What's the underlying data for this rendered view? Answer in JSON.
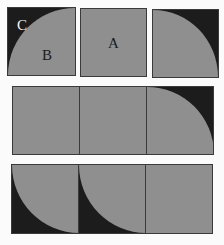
{
  "diagram": {
    "colors": {
      "gray": "#8f8f8f",
      "dark": "#1c1c1c",
      "border": "#3a3a3a",
      "background": "#fbfbfb"
    },
    "row1": {
      "tiles": [
        {
          "id": "tile-1",
          "shading": "quarter-circle centered bottom-right, dark top-left corner",
          "labels": [
            "C",
            "B"
          ]
        },
        {
          "id": "tile-2",
          "shading": "solid gray",
          "labels": [
            "A"
          ]
        },
        {
          "id": "tile-3",
          "shading": "quarter-circle centered bottom-left, dark top-right corner",
          "labels": []
        }
      ]
    },
    "row2": {
      "cells": [
        {
          "shading": "solid gray"
        },
        {
          "shading": "solid gray"
        },
        {
          "shading": "quarter-circle centered bottom-left, dark top-right corner"
        }
      ]
    },
    "row3": {
      "cells": [
        {
          "shading": "quarter-circle centered top-right, dark bottom-left corner"
        },
        {
          "shading": "quarter-circle centered top-right, dark bottom-left corner"
        },
        {
          "shading": "solid gray"
        }
      ]
    },
    "labels": {
      "c": "C",
      "b": "B",
      "a": "A"
    }
  }
}
